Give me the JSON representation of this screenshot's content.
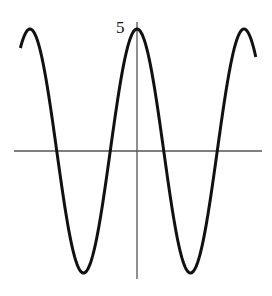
{
  "chart_data": {
    "type": "line",
    "title": "",
    "xlabel": "",
    "ylabel": "",
    "function": "y = 5cos(kx)",
    "amplitude": 5,
    "y_tick_labels": [
      "5"
    ],
    "x_tick_labels": [],
    "ylim": [
      -5,
      5
    ],
    "x_range_periods": [
      -1.09,
      1.11
    ],
    "grid": false,
    "legend": null,
    "series": [
      {
        "name": "curve",
        "description": "cosine wave with maximum 5 at x = 0, minima -5 at half periods",
        "peaks_periods": [
          -1,
          0,
          1
        ],
        "troughs_periods": [
          -0.5,
          0.5
        ]
      }
    ],
    "colors": {
      "curve": "#111111",
      "axes": "#555555"
    }
  },
  "labels": {
    "y_max": "5"
  }
}
